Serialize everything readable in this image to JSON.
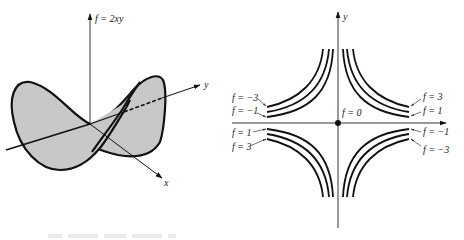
{
  "figure": {
    "left_panel": {
      "title": "Saddle surface",
      "function_label": "f = 2xy",
      "x_axis_label": "x",
      "y_axis_label": "y"
    },
    "right_panel": {
      "title": "Level curves",
      "y_axis_label": "y",
      "origin_label": "f = 0",
      "level_labels": {
        "q2_outer": "f = −3",
        "q2_inner": "f = −1",
        "q3_inner": "f = 1",
        "q3_outer": "f = 3",
        "q1_outer": "f = 3",
        "q1_inner": "f = 1",
        "q4_inner": "f = −1",
        "q4_outer": "f = −3"
      }
    },
    "colors": {
      "surface_fill": "#c8c8c8",
      "ink": "#111111"
    }
  }
}
